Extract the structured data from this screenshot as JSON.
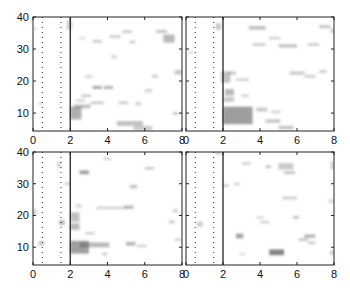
{
  "chart_data": [
    {
      "type": "heatmap",
      "panel": "top-left",
      "title": "",
      "xlabel": "",
      "ylabel": "",
      "xlim": [
        0,
        8
      ],
      "ylim": [
        4.4,
        40
      ],
      "xticks": [
        0,
        2,
        4,
        6,
        8
      ],
      "yticks": [
        10,
        20,
        30,
        40
      ],
      "xtick_labels": [
        "0",
        "2",
        "4",
        "6",
        "8"
      ],
      "ytick_labels": [
        "10",
        "20",
        "30",
        "40"
      ],
      "grid": false,
      "vlines": [
        {
          "x": 0.5,
          "style": "dotted"
        },
        {
          "x": 1.5,
          "style": "dotted"
        },
        {
          "x": 2,
          "style": "solid"
        }
      ],
      "blobs": [
        {
          "x": 2.0,
          "y": 8.0,
          "w": 0.6,
          "h": 4.0,
          "v": 0.45
        },
        {
          "x": 2.2,
          "y": 11.5,
          "w": 0.9,
          "h": 1.2,
          "v": 0.35
        },
        {
          "x": 2.3,
          "y": 13.5,
          "w": 0.5,
          "h": 0.8,
          "v": 0.25
        },
        {
          "x": 2.6,
          "y": 15.0,
          "w": 0.5,
          "h": 0.8,
          "v": 0.3
        },
        {
          "x": 3.2,
          "y": 17.5,
          "w": 0.5,
          "h": 1.0,
          "v": 0.45
        },
        {
          "x": 3.8,
          "y": 17.5,
          "w": 0.5,
          "h": 1.0,
          "v": 0.4
        },
        {
          "x": 2.8,
          "y": 21.0,
          "w": 0.4,
          "h": 0.8,
          "v": 0.25
        },
        {
          "x": 3.1,
          "y": 12.8,
          "w": 0.7,
          "h": 0.8,
          "v": 0.3
        },
        {
          "x": 4.6,
          "y": 12.8,
          "w": 0.5,
          "h": 0.8,
          "v": 0.3
        },
        {
          "x": 5.5,
          "y": 12.5,
          "w": 0.3,
          "h": 0.8,
          "v": 0.3
        },
        {
          "x": 4.5,
          "y": 6.0,
          "w": 1.4,
          "h": 1.5,
          "v": 0.35
        },
        {
          "x": 5.4,
          "y": 4.6,
          "w": 1.0,
          "h": 1.4,
          "v": 0.3
        },
        {
          "x": 7.5,
          "y": 9.5,
          "w": 0.3,
          "h": 0.8,
          "v": 0.35
        },
        {
          "x": 6.0,
          "y": 16.5,
          "w": 0.4,
          "h": 1.0,
          "v": 0.25
        },
        {
          "x": 6.4,
          "y": 21.0,
          "w": 0.3,
          "h": 1.0,
          "v": 0.25
        },
        {
          "x": 7.6,
          "y": 22.0,
          "w": 0.4,
          "h": 1.5,
          "v": 0.3
        },
        {
          "x": 7.0,
          "y": 32.0,
          "w": 0.6,
          "h": 2.5,
          "v": 0.4
        },
        {
          "x": 6.6,
          "y": 35.0,
          "w": 0.6,
          "h": 1.0,
          "v": 0.3
        },
        {
          "x": 4.8,
          "y": 35.0,
          "w": 0.5,
          "h": 0.8,
          "v": 0.3
        },
        {
          "x": 4.1,
          "y": 33.5,
          "w": 0.6,
          "h": 0.8,
          "v": 0.3
        },
        {
          "x": 3.2,
          "y": 32.0,
          "w": 0.5,
          "h": 0.8,
          "v": 0.3
        },
        {
          "x": 5.2,
          "y": 31.8,
          "w": 0.3,
          "h": 0.8,
          "v": 0.3
        },
        {
          "x": 4.2,
          "y": 27.0,
          "w": 0.3,
          "h": 1.2,
          "v": 0.2
        },
        {
          "x": 2.5,
          "y": 33.0,
          "w": 0.3,
          "h": 0.8,
          "v": 0.2
        },
        {
          "x": 1.8,
          "y": 36.0,
          "w": 0.3,
          "h": 3.0,
          "v": 0.25
        },
        {
          "x": 0.0,
          "y": 36.0,
          "w": 0.2,
          "h": 0.8,
          "v": 0.2
        },
        {
          "x": 0.3,
          "y": 12.5,
          "w": 0.2,
          "h": 1.0,
          "v": 0.2
        }
      ]
    },
    {
      "type": "heatmap",
      "panel": "top-right",
      "title": "",
      "xlabel": "",
      "ylabel": "",
      "xlim": [
        0,
        8
      ],
      "ylim": [
        4.4,
        40
      ],
      "xticks": [
        0,
        2,
        4,
        6,
        8
      ],
      "yticks": [
        10,
        20,
        30,
        40
      ],
      "xtick_labels": [
        "0",
        "2",
        "4",
        "6",
        "8"
      ],
      "ytick_labels": [],
      "grid": false,
      "vlines": [
        {
          "x": 0.5,
          "style": "dotted"
        },
        {
          "x": 1.5,
          "style": "dotted"
        },
        {
          "x": 2,
          "style": "solid"
        }
      ],
      "blobs": [
        {
          "x": 2.0,
          "y": 6.5,
          "w": 1.6,
          "h": 5.5,
          "v": 0.55
        },
        {
          "x": 2.0,
          "y": 13.5,
          "w": 0.6,
          "h": 1.5,
          "v": 0.3
        },
        {
          "x": 2.1,
          "y": 15.5,
          "w": 0.5,
          "h": 2.0,
          "v": 0.4
        },
        {
          "x": 1.9,
          "y": 19.5,
          "w": 0.5,
          "h": 3.5,
          "v": 0.35
        },
        {
          "x": 2.3,
          "y": 22.0,
          "w": 0.4,
          "h": 1.0,
          "v": 0.3
        },
        {
          "x": 3.0,
          "y": 15.0,
          "w": 0.4,
          "h": 0.8,
          "v": 0.25
        },
        {
          "x": 2.7,
          "y": 20.0,
          "w": 0.7,
          "h": 0.8,
          "v": 0.25
        },
        {
          "x": 3.8,
          "y": 10.5,
          "w": 0.6,
          "h": 1.2,
          "v": 0.3
        },
        {
          "x": 4.3,
          "y": 7.0,
          "w": 0.8,
          "h": 1.0,
          "v": 0.35
        },
        {
          "x": 5.0,
          "y": 5.0,
          "w": 0.8,
          "h": 1.0,
          "v": 0.35
        },
        {
          "x": 4.6,
          "y": 10.0,
          "w": 0.5,
          "h": 0.8,
          "v": 0.25
        },
        {
          "x": 5.6,
          "y": 22.0,
          "w": 0.8,
          "h": 1.0,
          "v": 0.3
        },
        {
          "x": 6.4,
          "y": 21.0,
          "w": 0.6,
          "h": 1.0,
          "v": 0.25
        },
        {
          "x": 7.2,
          "y": 22.5,
          "w": 0.4,
          "h": 1.0,
          "v": 0.25
        },
        {
          "x": 3.6,
          "y": 31.0,
          "w": 0.7,
          "h": 0.8,
          "v": 0.3
        },
        {
          "x": 5.0,
          "y": 30.5,
          "w": 1.0,
          "h": 1.0,
          "v": 0.35
        },
        {
          "x": 6.6,
          "y": 31.0,
          "w": 0.6,
          "h": 0.8,
          "v": 0.3
        },
        {
          "x": 7.2,
          "y": 36.5,
          "w": 0.6,
          "h": 1.0,
          "v": 0.3
        },
        {
          "x": 3.4,
          "y": 36.0,
          "w": 0.9,
          "h": 1.2,
          "v": 0.35
        },
        {
          "x": 4.5,
          "y": 33.0,
          "w": 0.6,
          "h": 0.8,
          "v": 0.25
        },
        {
          "x": 1.6,
          "y": 36.0,
          "w": 0.3,
          "h": 2.0,
          "v": 0.3
        },
        {
          "x": 0.1,
          "y": 28.5,
          "w": 0.3,
          "h": 0.8,
          "v": 0.2
        },
        {
          "x": 7.8,
          "y": 35.0,
          "w": 0.2,
          "h": 1.5,
          "v": 0.25
        }
      ]
    },
    {
      "type": "heatmap",
      "panel": "bottom-left",
      "title": "",
      "xlabel": "",
      "ylabel": "",
      "xlim": [
        0,
        8
      ],
      "ylim": [
        4.4,
        40
      ],
      "xticks": [
        0,
        2,
        4,
        6,
        8
      ],
      "yticks": [
        10,
        20,
        30,
        40
      ],
      "xtick_labels": [
        "0",
        "2",
        "4",
        "6",
        "8"
      ],
      "ytick_labels": [
        "10",
        "20",
        "30",
        "40"
      ],
      "grid": false,
      "vlines": [
        {
          "x": 0.5,
          "style": "dotted"
        },
        {
          "x": 1.5,
          "style": "dotted"
        },
        {
          "x": 2,
          "style": "solid"
        }
      ],
      "blobs": [
        {
          "x": 2.0,
          "y": 8.0,
          "w": 1.0,
          "h": 4.0,
          "v": 0.55
        },
        {
          "x": 2.5,
          "y": 10.0,
          "w": 1.6,
          "h": 1.5,
          "v": 0.4
        },
        {
          "x": 2.0,
          "y": 15.5,
          "w": 0.5,
          "h": 2.0,
          "v": 0.4
        },
        {
          "x": 2.0,
          "y": 18.0,
          "w": 0.5,
          "h": 3.0,
          "v": 0.35
        },
        {
          "x": 2.3,
          "y": 22.5,
          "w": 0.3,
          "h": 1.0,
          "v": 0.25
        },
        {
          "x": 2.5,
          "y": 33.0,
          "w": 0.5,
          "h": 1.2,
          "v": 0.55
        },
        {
          "x": 3.4,
          "y": 22.0,
          "w": 1.6,
          "h": 0.8,
          "v": 0.25
        },
        {
          "x": 4.9,
          "y": 22.0,
          "w": 0.5,
          "h": 1.2,
          "v": 0.35
        },
        {
          "x": 5.0,
          "y": 10.5,
          "w": 0.5,
          "h": 1.2,
          "v": 0.4
        },
        {
          "x": 5.6,
          "y": 10.0,
          "w": 0.5,
          "h": 0.8,
          "v": 0.25
        },
        {
          "x": 5.2,
          "y": 28.5,
          "w": 0.4,
          "h": 1.2,
          "v": 0.3
        },
        {
          "x": 6.0,
          "y": 34.5,
          "w": 0.5,
          "h": 0.8,
          "v": 0.3
        },
        {
          "x": 3.8,
          "y": 37.5,
          "w": 0.4,
          "h": 0.8,
          "v": 0.25
        },
        {
          "x": 2.8,
          "y": 14.0,
          "w": 0.5,
          "h": 0.8,
          "v": 0.25
        },
        {
          "x": 7.3,
          "y": 17.5,
          "w": 0.3,
          "h": 1.0,
          "v": 0.3
        },
        {
          "x": 7.5,
          "y": 21.0,
          "w": 0.3,
          "h": 1.0,
          "v": 0.25
        },
        {
          "x": 7.6,
          "y": 12.0,
          "w": 0.4,
          "h": 0.8,
          "v": 0.25
        },
        {
          "x": 1.4,
          "y": 17.0,
          "w": 0.3,
          "h": 1.5,
          "v": 0.4
        },
        {
          "x": 1.7,
          "y": 29.5,
          "w": 0.3,
          "h": 1.0,
          "v": 0.25
        },
        {
          "x": 1.3,
          "y": 35.0,
          "w": 0.2,
          "h": 2.0,
          "v": 0.25
        },
        {
          "x": 0.0,
          "y": 20.0,
          "w": 0.2,
          "h": 2.0,
          "v": 0.25
        },
        {
          "x": 0.3,
          "y": 10.5,
          "w": 0.3,
          "h": 1.5,
          "v": 0.3
        },
        {
          "x": 3.7,
          "y": 7.5,
          "w": 0.3,
          "h": 0.8,
          "v": 0.3
        }
      ]
    },
    {
      "type": "heatmap",
      "panel": "bottom-right",
      "title": "",
      "xlabel": "",
      "ylabel": "",
      "xlim": [
        0,
        8
      ],
      "ylim": [
        4.4,
        40
      ],
      "xticks": [
        0,
        2,
        4,
        6,
        8
      ],
      "yticks": [
        10,
        20,
        30,
        40
      ],
      "xtick_labels": [
        "0",
        "2",
        "4",
        "6",
        "8"
      ],
      "ytick_labels": [],
      "grid": false,
      "vlines": [
        {
          "x": 0.5,
          "style": "dotted"
        },
        {
          "x": 1.5,
          "style": "dotted"
        },
        {
          "x": 2,
          "style": "solid"
        }
      ],
      "blobs": [
        {
          "x": 4.5,
          "y": 7.5,
          "w": 0.8,
          "h": 1.8,
          "v": 0.7
        },
        {
          "x": 2.7,
          "y": 12.8,
          "w": 0.4,
          "h": 1.5,
          "v": 0.5
        },
        {
          "x": 6.4,
          "y": 13.0,
          "w": 0.6,
          "h": 1.0,
          "v": 0.45
        },
        {
          "x": 6.1,
          "y": 12.0,
          "w": 0.5,
          "h": 0.8,
          "v": 0.35
        },
        {
          "x": 6.6,
          "y": 11.0,
          "w": 0.4,
          "h": 0.8,
          "v": 0.3
        },
        {
          "x": 5.8,
          "y": 19.0,
          "w": 0.3,
          "h": 0.8,
          "v": 0.4
        },
        {
          "x": 4.0,
          "y": 17.5,
          "w": 0.5,
          "h": 0.8,
          "v": 0.25
        },
        {
          "x": 5.2,
          "y": 25.0,
          "w": 0.8,
          "h": 1.0,
          "v": 0.25
        },
        {
          "x": 5.0,
          "y": 34.5,
          "w": 0.8,
          "h": 2.0,
          "v": 0.3
        },
        {
          "x": 5.3,
          "y": 33.0,
          "w": 0.6,
          "h": 1.0,
          "v": 0.3
        },
        {
          "x": 4.3,
          "y": 35.0,
          "w": 0.3,
          "h": 0.8,
          "v": 0.35
        },
        {
          "x": 3.0,
          "y": 36.0,
          "w": 0.5,
          "h": 0.8,
          "v": 0.25
        },
        {
          "x": 2.0,
          "y": 29.0,
          "w": 0.3,
          "h": 0.8,
          "v": 0.3
        },
        {
          "x": 2.6,
          "y": 29.5,
          "w": 0.3,
          "h": 0.8,
          "v": 0.25
        },
        {
          "x": 7.8,
          "y": 34.5,
          "w": 0.2,
          "h": 2.5,
          "v": 0.25
        },
        {
          "x": 7.7,
          "y": 24.0,
          "w": 0.3,
          "h": 1.0,
          "v": 0.25
        },
        {
          "x": 7.8,
          "y": 7.5,
          "w": 0.2,
          "h": 1.5,
          "v": 0.3
        },
        {
          "x": 0.6,
          "y": 16.5,
          "w": 0.3,
          "h": 1.5,
          "v": 0.3
        },
        {
          "x": 1.6,
          "y": 39.0,
          "w": 0.3,
          "h": 1.0,
          "v": 0.25
        },
        {
          "x": 2.9,
          "y": 7.5,
          "w": 0.3,
          "h": 0.8,
          "v": 0.2
        },
        {
          "x": 3.8,
          "y": 19.0,
          "w": 0.4,
          "h": 0.8,
          "v": 0.2
        }
      ]
    }
  ],
  "layout": {
    "panels": [
      {
        "left": 33,
        "top": 17,
        "width": 149,
        "height": 114
      },
      {
        "left": 186,
        "top": 17,
        "width": 148,
        "height": 114
      },
      {
        "left": 33,
        "top": 152,
        "width": 149,
        "height": 113
      },
      {
        "left": 186,
        "top": 152,
        "width": 148,
        "height": 113
      }
    ],
    "ink_color": "#222222",
    "blob_color": "#505050"
  }
}
